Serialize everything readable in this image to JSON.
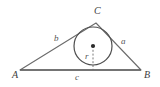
{
  "figure": {
    "type": "triangle-with-incircle",
    "background_color": "#ffffff",
    "stroke_color": "#6b6b6b",
    "label_color": "#4a4a4a",
    "vertices": {
      "A": {
        "label": "A",
        "x": 20,
        "y": 70,
        "label_x": 12,
        "label_y": 70
      },
      "B": {
        "label": "B",
        "x": 141,
        "y": 70,
        "label_x": 144,
        "label_y": 70
      },
      "C": {
        "label": "C",
        "x": 96,
        "y": 23,
        "label_x": 94,
        "label_y": 7
      }
    },
    "sides": {
      "a": {
        "label": "a",
        "from": "B",
        "to": "C",
        "label_x": 121,
        "label_y": 38
      },
      "b": {
        "label": "b",
        "from": "A",
        "to": "C",
        "label_x": 54,
        "label_y": 35
      },
      "c": {
        "label": "c",
        "from": "A",
        "to": "B",
        "label_x": 75,
        "label_y": 74
      }
    },
    "incircle": {
      "center_x": 93,
      "center_y": 46,
      "radius": 19,
      "center_dot_radius": 2,
      "radius_label": "r",
      "radius_label_x": 85,
      "radius_label_y": 53,
      "radius_line_style": "dashed",
      "tangent_point_base_x": 93,
      "tangent_point_base_y": 70
    }
  }
}
